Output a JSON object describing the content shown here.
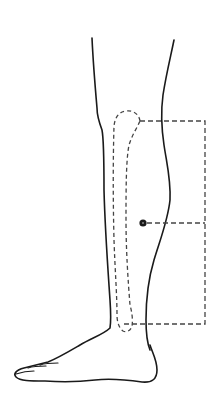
{
  "figure": {
    "title": "Lower leg lateral view with tibia outline and marked point",
    "colors": {
      "outline": "#1a1a1a",
      "dashed": "#444444",
      "marker": "#1a1a1a",
      "background": "#ffffff"
    },
    "elements": {
      "leg_outline": "solid outline of lower leg and foot",
      "tibia_outline": "dashed outline of tibia bone",
      "measurement_bracket": "dashed bracket from knee level to ankle level",
      "point_marker": "filled circle marker on calf connected to bracket"
    }
  }
}
